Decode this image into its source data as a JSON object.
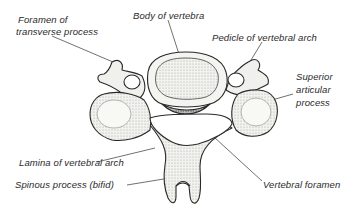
{
  "figure": {
    "labels": {
      "foramen_transverse_line1": "Foramen of",
      "foramen_transverse_line2": "transverse process",
      "body": "Body of vertebra",
      "pedicle": "Pedicle of vertebral arch",
      "superior_line1": "Superior",
      "superior_line2": "articular",
      "superior_line3": "process",
      "lamina": "Lamina of vertebral arch",
      "spinous": "Spinous process (bifid)",
      "vertebral_foramen": "Vertebral foramen"
    },
    "colors": {
      "ink": "#2a2a2a",
      "bone_fill": "#f4f4f2",
      "shade": "#b8b8b4",
      "background": "#ffffff"
    }
  }
}
